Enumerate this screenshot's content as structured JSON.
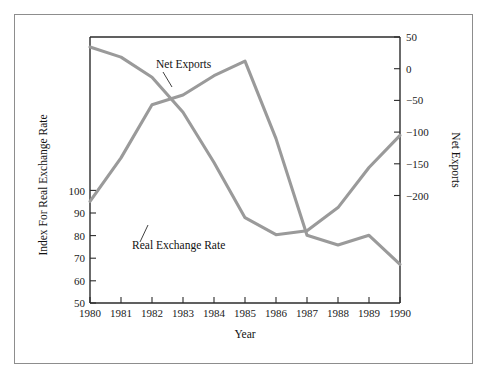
{
  "chart_data": {
    "type": "line",
    "title": "",
    "xlabel": "Year",
    "ylabel": "Index For Real Exchange Rate",
    "y2label": "Net Exports",
    "x": [
      1980,
      1981,
      1982,
      1983,
      1984,
      1985,
      1986,
      1987,
      1988,
      1989,
      1990
    ],
    "xtick_labels": [
      "1980",
      "1981",
      "1982",
      "1983",
      "1984",
      "1985",
      "1986",
      "1987",
      "1988",
      "1989",
      "1990"
    ],
    "xlim": [
      1980,
      1990
    ],
    "ylim": [
      50,
      105
    ],
    "ytick_labels": [
      "50",
      "60",
      "70",
      "80",
      "90",
      "100"
    ],
    "yticks": [
      50,
      60,
      70,
      80,
      90,
      100
    ],
    "y2lim": [
      -215,
      50
    ],
    "y2tick_labels": [
      "50",
      "0",
      "−50",
      "−100",
      "−150",
      "−200"
    ],
    "y2ticks": [
      50,
      0,
      -50,
      -100,
      -150,
      -200
    ],
    "grid": false,
    "legend_position": "inline-annotations",
    "series": [
      {
        "name": "Real Exchange Rate",
        "axis": "left",
        "color": "#9a9a9a",
        "values": [
          71,
          80,
          91,
          93,
          97,
          100,
          84,
          64,
          62,
          64,
          58
        ]
      },
      {
        "name": "Net Exports",
        "axis": "right",
        "color": "#9a9a9a",
        "values": [
          40,
          30,
          10,
          -25,
          -75,
          -130,
          -147,
          -143,
          -120,
          -80,
          -48
        ]
      }
    ],
    "annotations": [
      {
        "text": "Net Exports",
        "x": 1983.2,
        "y_right": 5
      },
      {
        "text": "Real Exchange Rate",
        "x": 1982.3,
        "y_left": 80
      }
    ]
  },
  "axis": {
    "left_title": "Index For Real Exchange Rate",
    "right_title": "Net Exports",
    "bottom_title": "Year"
  },
  "colors": {
    "series_line": "#9a9a9a",
    "axis": "#2b2b2b",
    "frame": "#8d8d8d",
    "text": "#111111",
    "background": "#ffffff"
  }
}
